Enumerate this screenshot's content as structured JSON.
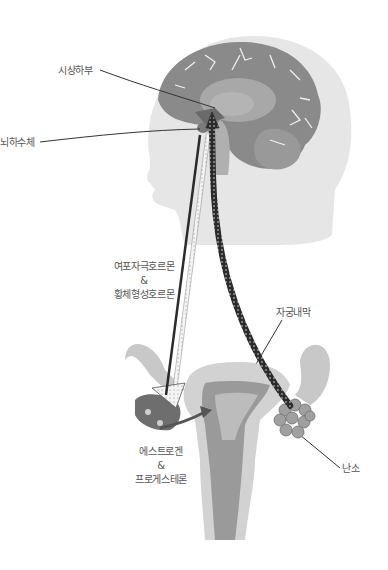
{
  "diagram": {
    "type": "hormone-feedback-axis",
    "labels": {
      "hypothalamus": "시상하부",
      "pituitary": "뇌하수체",
      "gonadotropins_line1": "여포자극호르몬",
      "gonadotropins_amp": "&",
      "gonadotropins_line2": "황체형성호르몬",
      "endometrium": "자궁내막",
      "sex_hormones_line1": "에스트로겐",
      "sex_hormones_amp": "&",
      "sex_hormones_line2": "프로게스테론",
      "ovary": "난소"
    },
    "colors": {
      "head": "#e6e6e6",
      "brain": "#8a8a8a",
      "brain_inner": "#a8a8a8",
      "uterus_outer": "#d2d2d2",
      "uterus_inner": "#9a9a9a",
      "arrow_dark": "#2b2b2b",
      "arrow_light": "#f2f2f2",
      "leader_line": "#333333"
    }
  }
}
